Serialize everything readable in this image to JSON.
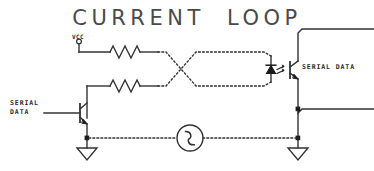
{
  "diagram": {
    "title": "CURRENT  LOOP",
    "background_color": "#ffffff",
    "wire_color": "#333333",
    "title_color": "#4a4a4a",
    "labels": {
      "vcc": "VCC",
      "serial_data_left": "SERIAL\nDATA",
      "serial_data_right": "SERIAL DATA"
    },
    "components": [
      {
        "name": "vcc-terminal",
        "type": "terminal"
      },
      {
        "name": "resistor-top",
        "type": "resistor"
      },
      {
        "name": "resistor-bottom",
        "type": "resistor"
      },
      {
        "name": "transistor-left",
        "type": "npn-transistor"
      },
      {
        "name": "twisted-pair",
        "type": "dotted-twisted-pair"
      },
      {
        "name": "optocoupler-led",
        "type": "led"
      },
      {
        "name": "optocoupler-phototransistor",
        "type": "phototransistor"
      },
      {
        "name": "current-source",
        "type": "ac-source"
      },
      {
        "name": "ground-left",
        "type": "ground"
      },
      {
        "name": "ground-right",
        "type": "ground"
      }
    ]
  }
}
